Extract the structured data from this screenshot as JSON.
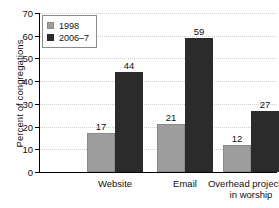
{
  "chart_data": {
    "type": "bar",
    "title": "",
    "subtitle": "",
    "xlabel": "",
    "ylabel": "Percent of congregations",
    "categories": [
      "Website",
      "Email",
      "Overhead projectors in worship"
    ],
    "category_lines": [
      [
        "Website"
      ],
      [
        "Email"
      ],
      [
        "Overhead projectors",
        "in worship"
      ]
    ],
    "series": [
      {
        "name": "1998",
        "color": "#9e9e9e",
        "values": [
          17,
          21,
          12
        ]
      },
      {
        "name": "2006–7",
        "color": "#2b2b2b",
        "values": [
          44,
          59,
          27
        ]
      }
    ],
    "ylim": [
      0,
      70
    ],
    "yticks": [
      0,
      10,
      20,
      30,
      40,
      50,
      60,
      70
    ],
    "ytick_labels": [
      "0",
      "10",
      "20",
      "30",
      "40",
      "50",
      "60",
      "70"
    ],
    "grid": true,
    "grid_axis": "y",
    "legend_position": "top-left",
    "data_labels": true,
    "background_color": "#ffffff",
    "axis_color": "#000000",
    "grid_color": "#cfcfcf"
  }
}
